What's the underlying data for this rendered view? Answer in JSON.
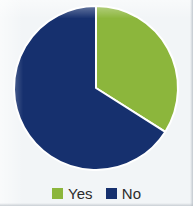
{
  "chart_data": {
    "type": "pie",
    "title": "",
    "categories": [
      "Yes",
      "No"
    ],
    "values": [
      34,
      66
    ],
    "value_unit": "percent",
    "slice_angles_deg": [
      122,
      238
    ],
    "start_angle_deg": 0,
    "direction": "clockwise",
    "colors": [
      "#8CB63C",
      "#16306E"
    ],
    "legend": {
      "position": "bottom",
      "entries": [
        {
          "label": "Yes",
          "color": "#8CB63C"
        },
        {
          "label": "No",
          "color": "#16306E"
        }
      ]
    },
    "labels_shown": false,
    "grid": false,
    "xlabel": "",
    "ylabel": ""
  },
  "palette": {
    "green": "#8CB63C",
    "blue": "#16306E",
    "background": "#F2F5F7",
    "slice_separator": "#FFFFFF",
    "legend_text": "#2B2B2B"
  },
  "geometry": {
    "center_x": 96,
    "center_y": 88,
    "radius": 82
  },
  "legend": {
    "yes_label": "Yes",
    "no_label": "No"
  }
}
